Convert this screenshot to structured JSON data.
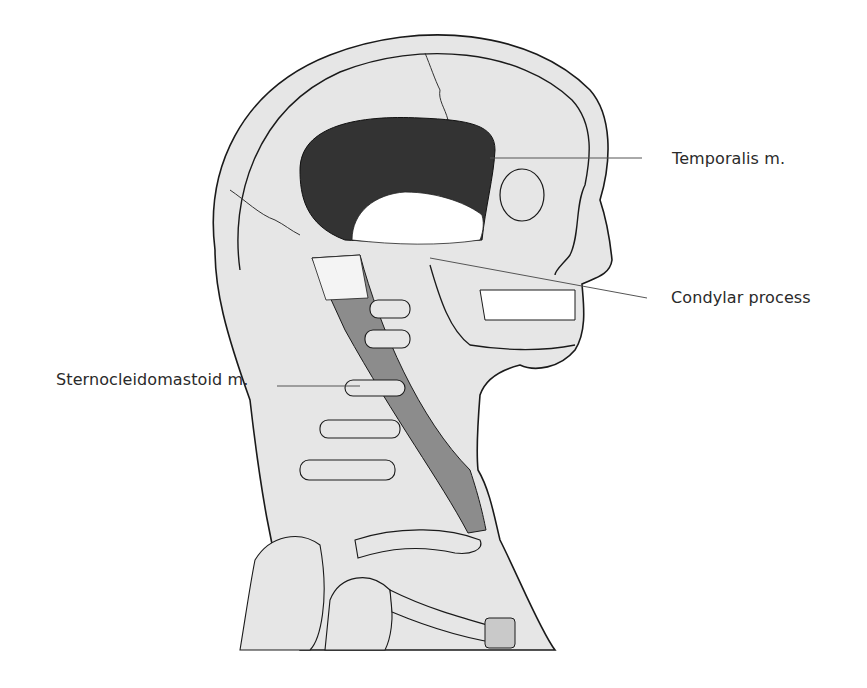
{
  "figure": {
    "colors": {
      "background": "#ffffff",
      "skin_fill": "#e6e6e6",
      "outline": "#1a1a1a",
      "temporalis_fill": "#333333",
      "scm_fill": "#8c8c8c",
      "tendon_fill": "#ffffff",
      "leader_line": "#555555"
    }
  },
  "labels": {
    "temporalis": "Temporalis m.",
    "condylar": "Condylar process",
    "scm": "Sternocleidomastoid m."
  }
}
